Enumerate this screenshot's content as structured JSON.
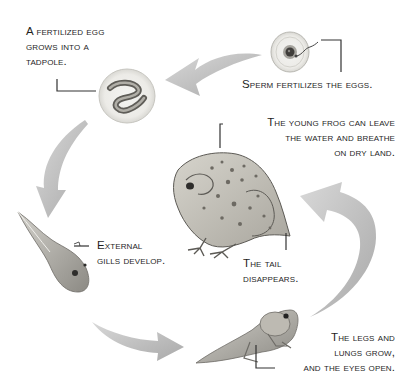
{
  "diagram": {
    "colors": {
      "arrow": "#b5b5b5",
      "leader_line": "#333333",
      "text": "#1f1f1f",
      "background": "#ffffff",
      "frog_body": "#c9c6bd",
      "frog_spots": "#6d6a63"
    },
    "stages": [
      {
        "id": "fertilization",
        "illustration": "egg-with-sperm",
        "label_lines": [
          "Sperm fertilizes the eggs."
        ]
      },
      {
        "id": "embryo",
        "illustration": "egg-with-embryo",
        "label_lines": [
          "A fertilized egg",
          "grows into a",
          "tadpole."
        ]
      },
      {
        "id": "tadpole",
        "illustration": "tadpole-with-gills",
        "label_lines": [
          "External",
          "gills develop."
        ]
      },
      {
        "id": "froglet",
        "illustration": "tadpole-with-legs",
        "label_lines": [
          "The legs and",
          "lungs grow,",
          "and the eyes open."
        ]
      },
      {
        "id": "young-frog",
        "illustration": "young-frog",
        "label_lines": [
          "The young frog can leave",
          "the water and breathe",
          "on dry land."
        ]
      },
      {
        "id": "tail-loss",
        "illustration": "frog-tail-stub",
        "label_lines": [
          "The tail",
          "disappears."
        ]
      }
    ],
    "arrows": [
      {
        "from": "fertilization",
        "to": "embryo",
        "direction": "left"
      },
      {
        "from": "embryo",
        "to": "tadpole",
        "direction": "down"
      },
      {
        "from": "tadpole",
        "to": "froglet",
        "direction": "right"
      },
      {
        "from": "froglet",
        "to": "young-frog",
        "direction": "up"
      }
    ]
  }
}
